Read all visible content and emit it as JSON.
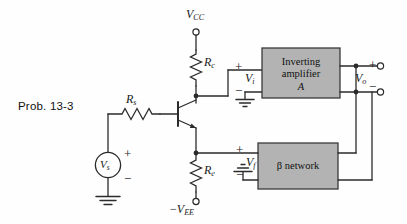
{
  "figure": {
    "caption": "Prob. 13-3",
    "kind": "transistor-feedback-amplifier-schematic"
  },
  "supplies": {
    "positive_rail": {
      "symbol": "V",
      "subscript": "CC",
      "prefix": ""
    },
    "negative_rail": {
      "symbol": "V",
      "subscript": "EE",
      "prefix": "−"
    }
  },
  "components": {
    "collector_resistor": {
      "symbol": "R",
      "subscript": "c"
    },
    "emitter_resistor": {
      "symbol": "R",
      "subscript": "e"
    },
    "source_resistor": {
      "symbol": "R",
      "subscript": "s"
    },
    "source": {
      "symbol": "V",
      "subscript": "s"
    },
    "transistor": {
      "type": "npn"
    }
  },
  "blocks": {
    "amplifier": {
      "line1": "Inverting",
      "line2": "amplifier",
      "line3": "A",
      "fill": "#b3b3b3",
      "stroke": "#3a3a3a"
    },
    "feedback": {
      "line1": "β network",
      "fill": "#b3b3b3",
      "stroke": "#3a3a3a"
    }
  },
  "nodes": {
    "input_voltage": {
      "symbol": "V",
      "subscript": "i",
      "plus": "+",
      "minus": "−"
    },
    "output_voltage": {
      "symbol": "V",
      "subscript": "o",
      "plus": "+",
      "minus": "−"
    },
    "feedback_voltage": {
      "symbol": "V",
      "subscript": "f",
      "plus": "+",
      "minus": "−"
    },
    "source_voltage": {
      "plus": "+",
      "minus": "−"
    }
  },
  "colors": {
    "wire": "#2b2b2b",
    "background": "#fefefe",
    "text": "#1a1a1a"
  }
}
